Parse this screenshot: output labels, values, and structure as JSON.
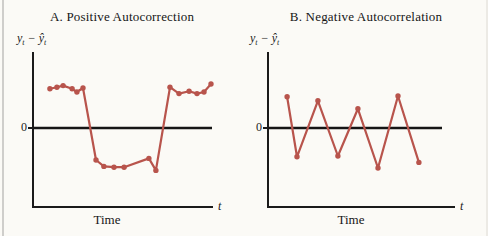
{
  "page": {
    "accent_color": "#b8544c",
    "axis_color": "#1a1a1a",
    "background_color": "#fbfaf6"
  },
  "chart_data": [
    {
      "id": "A",
      "type": "line",
      "title": "A. Positive Autocorrection",
      "ylabel": {
        "base": "y",
        "sub": "t",
        "minus": "−",
        "base_hat": "ŷ",
        "sub2": "t"
      },
      "zero_tick_label": "0",
      "xlabel": "Time",
      "x_end_label": "t",
      "xlim": [
        0,
        1
      ],
      "ylim": [
        -1,
        1
      ],
      "grid": false,
      "legend": "none",
      "marker": "circle",
      "x": [
        0.094,
        0.133,
        0.167,
        0.217,
        0.244,
        0.278,
        0.35,
        0.394,
        0.45,
        0.506,
        0.644,
        0.683,
        0.761,
        0.811,
        0.867,
        0.911,
        0.95,
        0.989
      ],
      "y": [
        0.49,
        0.51,
        0.53,
        0.49,
        0.45,
        0.5,
        -0.4,
        -0.48,
        -0.49,
        -0.49,
        -0.38,
        -0.53,
        0.51,
        0.43,
        0.46,
        0.43,
        0.45,
        0.55
      ]
    },
    {
      "id": "B",
      "type": "line",
      "title": "B. Negative Autocorrelation",
      "ylabel": {
        "base": "y",
        "sub": "t",
        "minus": "−",
        "base_hat": "ŷ",
        "sub2": "t"
      },
      "zero_tick_label": "0",
      "xlabel": "Time",
      "x_end_label": "t",
      "xlim": [
        0,
        1
      ],
      "ylim": [
        -1,
        1
      ],
      "grid": false,
      "legend": "none",
      "marker": "circle",
      "x": [
        0.102,
        0.155,
        0.267,
        0.374,
        0.481,
        0.588,
        0.695,
        0.807
      ],
      "y": [
        0.39,
        -0.36,
        0.34,
        -0.35,
        0.24,
        -0.5,
        0.4,
        -0.43
      ]
    }
  ]
}
